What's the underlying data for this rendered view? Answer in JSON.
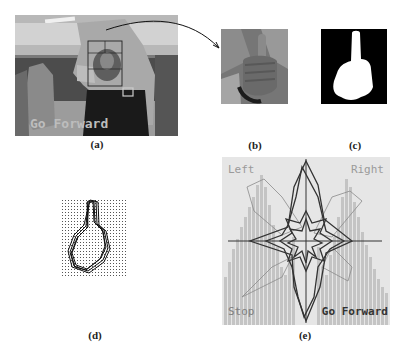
{
  "figure": {
    "panels": [
      {
        "id": "a",
        "caption": "(a)",
        "description": "camera frame of person making thumbs-up gesture with tracking box",
        "overlay_text": "Go Forward"
      },
      {
        "id": "b",
        "caption": "(b)",
        "description": "cropped hand region"
      },
      {
        "id": "c",
        "caption": "(c)",
        "description": "binary segmentation mask of hand"
      },
      {
        "id": "d",
        "caption": "(d)",
        "description": "hand contours on dotted grid"
      },
      {
        "id": "e",
        "caption": "(e)",
        "description": "polar contour plots over histogram",
        "corner_labels": {
          "top_left": "Left",
          "top_right": "Right",
          "bottom_left": "Stop",
          "bottom_right": "Go Forward"
        }
      }
    ]
  },
  "colors": {
    "background": "#ffffff",
    "mask_fg": "#ffffff",
    "mask_bg": "#000000",
    "plot_bg": "#e4e4e4",
    "histogram_bar": "#c2c2c2",
    "contour_dark": "#3a3a3a",
    "contour_light": "#8a8a8a"
  }
}
